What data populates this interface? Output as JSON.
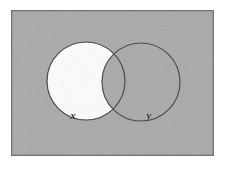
{
  "figure": {
    "name": "venn-diagram",
    "background_color": "#ffffff",
    "universal_set": {
      "name": "universal-set-rectangle",
      "fill_color": "#a9a9a9",
      "border_color": "#6a6a6a",
      "x": 11,
      "y": 10,
      "width": 203,
      "height": 146
    },
    "circles": [
      {
        "name": "set-x-circle",
        "label": "x",
        "cx": 86,
        "cy": 81,
        "r": 39,
        "outline_color": "#3a3a3a",
        "label_x": 73,
        "label_y": 119
      },
      {
        "name": "set-y-circle",
        "label": "y",
        "cx": 141,
        "cy": 82,
        "r": 39,
        "outline_color": "#3a3a3a",
        "label_x": 148,
        "label_y": 119
      }
    ],
    "shaded_region": {
      "name": "x-only-region",
      "description": "X minus Y",
      "fill_color": "#ffffff"
    }
  }
}
